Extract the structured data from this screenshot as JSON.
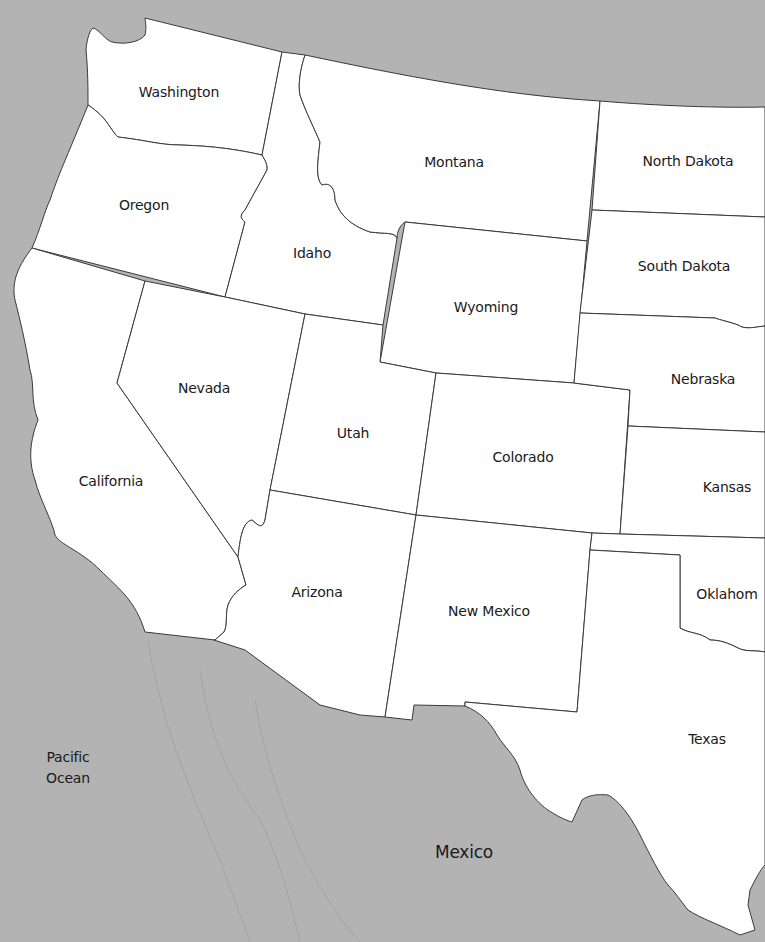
{
  "map": {
    "title": "Western United States",
    "colors": {
      "water_land_background": "#b3b3b3",
      "state_fill": "#ffffff",
      "border": "#3a3a3a"
    },
    "states": [
      {
        "id": "washington",
        "label": "Washington"
      },
      {
        "id": "oregon",
        "label": "Oregon"
      },
      {
        "id": "california",
        "label": "California"
      },
      {
        "id": "idaho",
        "label": "Idaho"
      },
      {
        "id": "nevada",
        "label": "Nevada"
      },
      {
        "id": "montana",
        "label": "Montana"
      },
      {
        "id": "wyoming",
        "label": "Wyoming"
      },
      {
        "id": "utah",
        "label": "Utah"
      },
      {
        "id": "arizona",
        "label": "Arizona"
      },
      {
        "id": "colorado",
        "label": "Colorado"
      },
      {
        "id": "new_mexico",
        "label": "New Mexico"
      },
      {
        "id": "north_dakota",
        "label": "North Dakota"
      },
      {
        "id": "south_dakota",
        "label": "South Dakota"
      },
      {
        "id": "nebraska",
        "label": "Nebraska"
      },
      {
        "id": "kansas",
        "label": "Kansas"
      },
      {
        "id": "oklahoma",
        "label": "Oklahom"
      },
      {
        "id": "texas",
        "label": "Texas"
      }
    ],
    "water": {
      "pacific_line1": "Pacific",
      "pacific_line2": "Ocean"
    },
    "countries": {
      "mexico": "Mexico"
    }
  }
}
